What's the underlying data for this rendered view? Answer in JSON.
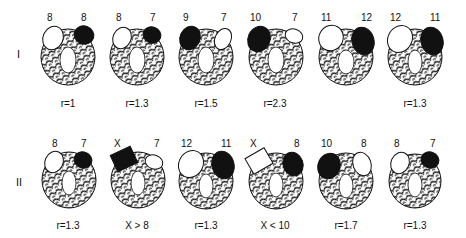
{
  "figure": {
    "rows": [
      {
        "label": "I",
        "cells": [
          {
            "left_value": "8",
            "right_value": "8",
            "left_fill": "white",
            "right_fill": "black",
            "left_shape": "ellipse",
            "right_shape": "ellipse",
            "caption": "r=1"
          },
          {
            "left_value": "8",
            "right_value": "7",
            "left_fill": "white",
            "right_fill": "black",
            "left_shape": "ellipse",
            "right_shape": "ellipse",
            "caption": "r=1.3"
          },
          {
            "left_value": "9",
            "right_value": "7",
            "left_fill": "black",
            "right_fill": "white",
            "left_shape": "ellipse",
            "right_shape": "ellipse",
            "caption": "r=1.5"
          },
          {
            "left_value": "10",
            "right_value": "7",
            "left_fill": "black",
            "right_fill": "white",
            "left_shape": "ellipse",
            "right_shape": "ellipse",
            "caption": "r=2.3"
          },
          {
            "left_value": "11",
            "right_value": "12",
            "left_fill": "white",
            "right_fill": "black",
            "left_shape": "ellipse",
            "right_shape": "ellipse",
            "caption": ""
          },
          {
            "left_value": "12",
            "right_value": "11",
            "left_fill": "white",
            "right_fill": "black",
            "left_shape": "ellipse",
            "right_shape": "ellipse",
            "caption": "r=1.3"
          }
        ]
      },
      {
        "label": "II",
        "cells": [
          {
            "left_value": "8",
            "right_value": "7",
            "left_fill": "white",
            "right_fill": "black",
            "left_shape": "ellipse",
            "right_shape": "ellipse",
            "caption": "r=1.3"
          },
          {
            "left_value": "X",
            "right_value": "7",
            "left_fill": "black",
            "right_fill": "white",
            "left_shape": "square",
            "right_shape": "ellipse",
            "caption": "X > 8"
          },
          {
            "left_value": "12",
            "right_value": "11",
            "left_fill": "white",
            "right_fill": "black",
            "left_shape": "ellipse",
            "right_shape": "ellipse",
            "caption": "r=1.3"
          },
          {
            "left_value": "X",
            "right_value": "8",
            "left_fill": "white",
            "right_fill": "black",
            "left_shape": "square",
            "right_shape": "ellipse",
            "caption": "X < 10"
          },
          {
            "left_value": "10",
            "right_value": "8",
            "left_fill": "black",
            "right_fill": "white",
            "left_shape": "ellipse",
            "right_shape": "ellipse",
            "caption": "r=1.7"
          },
          {
            "left_value": "8",
            "right_value": "7",
            "left_fill": "white",
            "right_fill": "black",
            "left_shape": "ellipse",
            "right_shape": "ellipse",
            "caption": "r=1.3"
          }
        ]
      }
    ]
  }
}
